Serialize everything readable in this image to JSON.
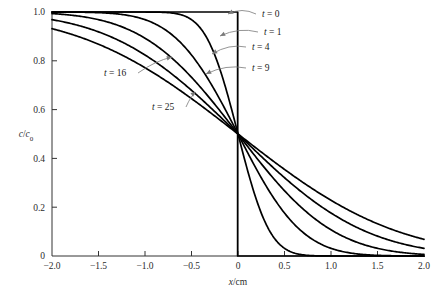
{
  "chart_data": {
    "type": "line",
    "title": "",
    "subtitle": "",
    "xlabel": "x/cm",
    "ylabel": "c/c0",
    "ylabel_display": "c/c₀",
    "xlim": [
      -2.0,
      2.0
    ],
    "ylim": [
      0.0,
      1.0
    ],
    "xticks": [
      -2.0,
      -1.5,
      -1.0,
      -0.5,
      0.0,
      0.5,
      1.0,
      1.5,
      2.0
    ],
    "xticklabels": [
      "−2.0",
      "−1.5",
      "−1.0",
      "−0.5",
      "0",
      "0.5",
      "1.0",
      "1.5",
      "2.0"
    ],
    "yticks": [
      0.0,
      0.2,
      0.4,
      0.6,
      0.8,
      1.0
    ],
    "yticklabels": [
      "0",
      "0.2",
      "0.4",
      "0.6",
      "0.8",
      "1.0"
    ],
    "grid": false,
    "legend": "inline-annotations",
    "crossing_point": {
      "x": 0.0,
      "y": 0.5
    },
    "annotations": [
      {
        "label": "t = 0",
        "t": 0,
        "x": 262,
        "y": 17,
        "anchor_x": 228,
        "anchor_y": 14
      },
      {
        "label": "t = 1",
        "t": 1,
        "x": 264,
        "y": 35,
        "anchor_x": 220,
        "anchor_y": 36
      },
      {
        "label": "t = 4",
        "t": 4,
        "x": 252,
        "y": 50,
        "anchor_x": 212,
        "anchor_y": 54
      },
      {
        "label": "t = 9",
        "t": 9,
        "x": 252,
        "y": 71,
        "anchor_x": 206,
        "anchor_y": 74
      },
      {
        "label": "t = 16",
        "t": 16,
        "x": 104,
        "y": 76,
        "anchor_x": 172,
        "anchor_y": 57
      },
      {
        "label": "t = 25",
        "t": 25,
        "x": 152,
        "y": 110,
        "anchor_x": 196,
        "anchor_y": 92
      }
    ],
    "series": [
      {
        "name": "t = 0",
        "t": 0,
        "description": "Step function: c/c0 = 1 for x < 0, c/c0 = 0 for x > 0",
        "x": [
          -2.0,
          -1.5,
          -1.0,
          -0.5,
          -0.25,
          -0.1,
          -0.02,
          0.0,
          0.02,
          0.1,
          0.25,
          0.5,
          1.0,
          1.5,
          2.0
        ],
        "values": [
          1.0,
          1.0,
          1.0,
          1.0,
          1.0,
          1.0,
          1.0,
          0.5,
          0.0,
          0.0,
          0.0,
          0.0,
          0.0,
          0.0,
          0.0
        ]
      },
      {
        "name": "t = 1",
        "t": 1,
        "x": [
          -2.0,
          -1.75,
          -1.5,
          -1.25,
          -1.0,
          -0.8,
          -0.6,
          -0.5,
          -0.4,
          -0.3,
          -0.2,
          -0.1,
          0.0,
          0.1,
          0.2,
          0.3,
          0.4,
          0.5,
          0.6,
          0.8,
          1.0,
          1.25,
          1.5,
          1.75,
          2.0
        ],
        "values": [
          1.0,
          1.0,
          1.0,
          1.0,
          1.0,
          0.999,
          0.995,
          0.989,
          0.977,
          0.953,
          0.909,
          0.823,
          0.5,
          0.177,
          0.091,
          0.047,
          0.023,
          0.011,
          0.005,
          0.001,
          0.0,
          0.0,
          0.0,
          0.0,
          0.0
        ]
      },
      {
        "name": "t = 4",
        "t": 4,
        "x": [
          -2.0,
          -1.75,
          -1.5,
          -1.25,
          -1.0,
          -0.8,
          -0.6,
          -0.4,
          -0.2,
          -0.1,
          0.0,
          0.1,
          0.2,
          0.4,
          0.6,
          0.8,
          1.0,
          1.25,
          1.5,
          1.75,
          2.0
        ],
        "values": [
          1.0,
          0.999,
          0.997,
          0.991,
          0.977,
          0.953,
          0.909,
          0.823,
          0.677,
          0.593,
          0.5,
          0.407,
          0.323,
          0.177,
          0.091,
          0.047,
          0.023,
          0.009,
          0.003,
          0.001,
          0.0
        ]
      },
      {
        "name": "t = 9",
        "t": 9,
        "x": [
          -2.0,
          -1.75,
          -1.5,
          -1.25,
          -1.0,
          -0.75,
          -0.5,
          -0.25,
          0.0,
          0.25,
          0.5,
          0.75,
          1.0,
          1.25,
          1.5,
          1.75,
          2.0
        ],
        "values": [
          0.991,
          0.983,
          0.969,
          0.947,
          0.909,
          0.853,
          0.776,
          0.65,
          0.5,
          0.35,
          0.224,
          0.147,
          0.091,
          0.053,
          0.031,
          0.017,
          0.009
        ]
      },
      {
        "name": "t = 16",
        "t": 16,
        "x": [
          -2.0,
          -1.75,
          -1.5,
          -1.25,
          -1.0,
          -0.75,
          -0.5,
          -0.25,
          0.0,
          0.25,
          0.5,
          0.75,
          1.0,
          1.25,
          1.5,
          1.75,
          2.0
        ],
        "values": [
          0.977,
          0.964,
          0.945,
          0.919,
          0.882,
          0.834,
          0.773,
          0.645,
          0.5,
          0.355,
          0.227,
          0.166,
          0.118,
          0.081,
          0.055,
          0.036,
          0.023
        ]
      },
      {
        "name": "t = 25",
        "t": 25,
        "x": [
          -2.0,
          -1.75,
          -1.5,
          -1.25,
          -1.0,
          -0.75,
          -0.5,
          -0.25,
          0.0,
          0.25,
          0.5,
          0.75,
          1.0,
          1.25,
          1.5,
          1.75,
          2.0
        ],
        "values": [
          0.955,
          0.937,
          0.915,
          0.887,
          0.853,
          0.811,
          0.76,
          0.638,
          0.5,
          0.362,
          0.24,
          0.189,
          0.147,
          0.113,
          0.085,
          0.063,
          0.045
        ]
      }
    ]
  },
  "colors": {
    "curve": "#000000",
    "axis": "#333333",
    "zero_line": "#8d8d8d",
    "leader": "#7a7a7a",
    "background": "#ffffff",
    "text": "#2b2b2b"
  }
}
